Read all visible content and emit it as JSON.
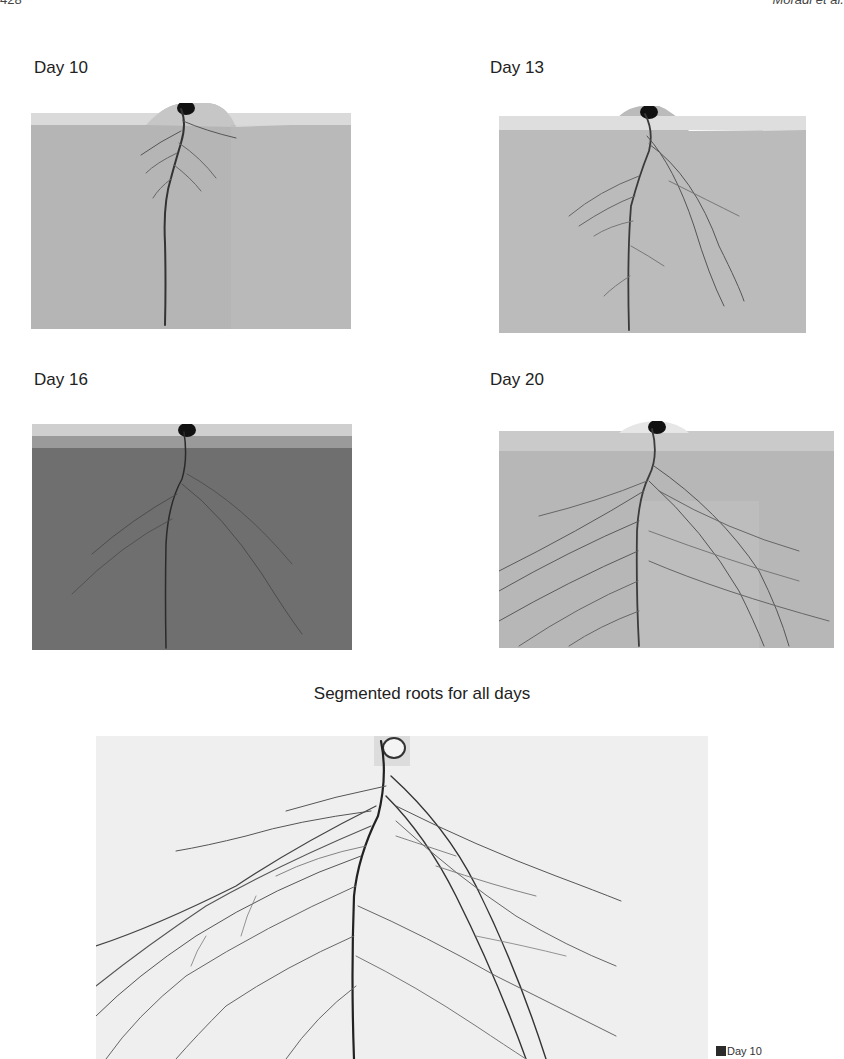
{
  "page": {
    "running_head_left": "428",
    "running_head_right": "Moradi et al."
  },
  "figure": {
    "panels": [
      {
        "label": "Day 10",
        "background": "#b4b4b4",
        "soil_top": "#d9d9d9"
      },
      {
        "label": "Day 13",
        "background": "#bababa",
        "soil_top": "#dcdcdc"
      },
      {
        "label": "Day 16",
        "background": "#717171",
        "soil_top": "#b8b8b8"
      },
      {
        "label": "Day 20",
        "background": "#b6b6b6",
        "soil_top": "#cfcfcf"
      }
    ],
    "composite_caption": "Segmented roots for all days",
    "composite_background": "#ededed",
    "legend": [
      {
        "label": "Day 10",
        "color": "#2b2b2b"
      }
    ]
  }
}
